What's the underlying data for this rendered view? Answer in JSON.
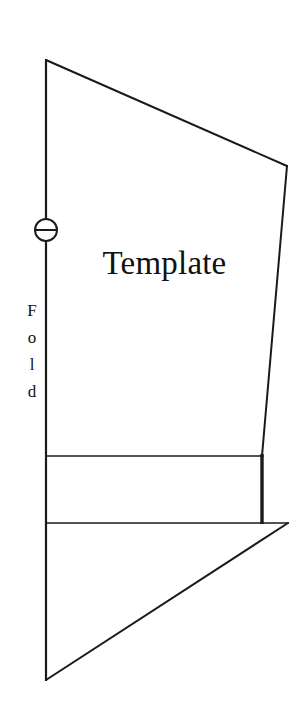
{
  "figure": {
    "background_color": "#ffffff",
    "line_color": "#1a1a1a",
    "text_color": "#111111",
    "width": 308,
    "height": 726
  },
  "labels": {
    "template": "Template",
    "fold_letters": [
      "F",
      "o",
      "l",
      "d"
    ],
    "fold_word": "Fold"
  },
  "markers": {
    "registration_mark": {
      "icon": "circle-plus-icon",
      "center_x": 46,
      "center_y": 230,
      "radius": 11
    }
  },
  "geometry": {
    "fold_line": {
      "x": 46,
      "y1": 60,
      "y2": 680,
      "stroke_width": 2.2
    },
    "top_diagonal": {
      "x1": 46,
      "y1": 60,
      "x2": 287,
      "y2": 166,
      "stroke_width": 2
    },
    "right_edge": {
      "x1": 287,
      "y1": 166,
      "x2": 262,
      "y2": 456,
      "stroke_width": 2
    },
    "upper_horizontal": {
      "x1": 46,
      "y1": 456,
      "x2": 262,
      "y2": 456,
      "stroke_width": 1.7
    },
    "bold_right_segment": {
      "x": 262,
      "y1": 455,
      "y2": 524,
      "stroke_width": 3.4
    },
    "lower_horizontal": {
      "x1": 46,
      "y1": 523,
      "x2": 288,
      "y2": 523,
      "stroke_width": 1.7
    },
    "bottom_diagonal": {
      "x1": 288,
      "y1": 523,
      "x2": 46,
      "y2": 680,
      "stroke_width": 2
    }
  }
}
